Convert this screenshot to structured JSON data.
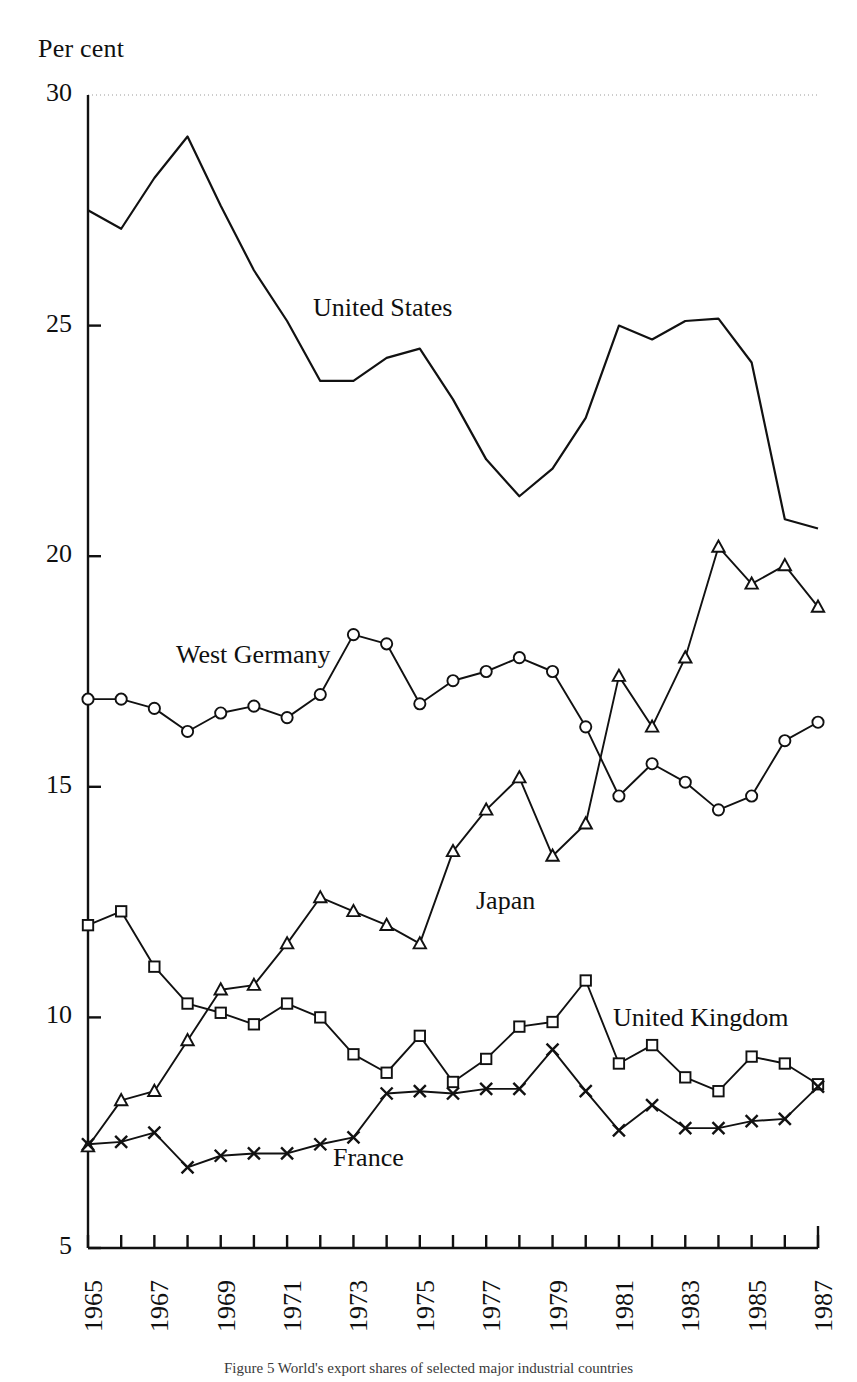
{
  "axis_unit_label": "Per cent",
  "caption": "Figure 5 World's export shares of selected major industrial countries",
  "series_labels": {
    "united_states": "United States",
    "west_germany": "West Germany",
    "japan": "Japan",
    "united_kingdom": "United Kingdom",
    "france": "France"
  },
  "chart_data": {
    "type": "line",
    "title": "",
    "xlabel": "",
    "ylabel": "Per cent",
    "xlim": [
      1965,
      1987
    ],
    "ylim": [
      5,
      30
    ],
    "yticks": [
      5,
      10,
      15,
      20,
      25,
      30
    ],
    "ytick_labels": [
      "5",
      "10",
      "15",
      "20",
      "25",
      "30"
    ],
    "x": [
      1965,
      1966,
      1967,
      1968,
      1969,
      1970,
      1971,
      1972,
      1973,
      1974,
      1975,
      1976,
      1977,
      1978,
      1979,
      1980,
      1981,
      1982,
      1983,
      1984,
      1985,
      1986,
      1987
    ],
    "xtick_labels": [
      "1965",
      "1966",
      "1967",
      "1968",
      "1969",
      "1970",
      "1971",
      "1972",
      "1973",
      "1974",
      "1975",
      "1976",
      "1977",
      "1978",
      "1979",
      "1980",
      "1981",
      "1982",
      "1983",
      "1984",
      "1985",
      "1986",
      "1987"
    ],
    "xtick_labels_shown": [
      "1965",
      "1967",
      "1969",
      "1971",
      "1973",
      "1975",
      "1977",
      "1979",
      "1981",
      "1983",
      "1985",
      "1987"
    ],
    "grid": false,
    "legend_position": "inline-annotations",
    "series": [
      {
        "name": "United States",
        "marker": "none",
        "values": [
          27.5,
          27.1,
          28.2,
          29.1,
          27.6,
          26.2,
          25.1,
          23.8,
          23.8,
          24.3,
          24.5,
          23.4,
          22.1,
          21.3,
          21.9,
          23.0,
          25.0,
          24.7,
          25.1,
          25.15,
          24.2,
          20.8,
          20.6
        ]
      },
      {
        "name": "West Germany",
        "marker": "circle",
        "values": [
          16.9,
          16.9,
          16.7,
          16.2,
          16.6,
          16.75,
          16.5,
          17.0,
          18.3,
          18.1,
          16.8,
          17.3,
          17.5,
          17.8,
          17.5,
          16.3,
          14.8,
          15.5,
          15.1,
          14.5,
          14.8,
          16.0,
          16.4
        ]
      },
      {
        "name": "Japan",
        "marker": "triangle",
        "values": [
          7.2,
          8.2,
          8.4,
          9.5,
          10.6,
          10.7,
          11.6,
          12.6,
          12.3,
          12.0,
          11.6,
          13.6,
          14.5,
          15.2,
          13.5,
          14.2,
          17.4,
          16.3,
          17.8,
          20.2,
          19.4,
          19.8,
          18.9
        ]
      },
      {
        "name": "United Kingdom",
        "marker": "square",
        "values": [
          12.0,
          12.3,
          11.1,
          10.3,
          10.1,
          9.85,
          10.3,
          10.0,
          9.2,
          8.8,
          9.6,
          8.6,
          9.1,
          9.8,
          9.9,
          10.8,
          9.0,
          9.4,
          8.7,
          8.4,
          9.15,
          9.0,
          8.55
        ]
      },
      {
        "name": "France",
        "marker": "cross",
        "values": [
          7.25,
          7.3,
          7.5,
          6.75,
          7.0,
          7.05,
          7.05,
          7.25,
          7.4,
          8.35,
          8.4,
          8.35,
          8.45,
          8.45,
          9.3,
          8.4,
          7.55,
          8.1,
          7.6,
          7.6,
          7.75,
          7.8,
          8.5
        ]
      }
    ]
  }
}
